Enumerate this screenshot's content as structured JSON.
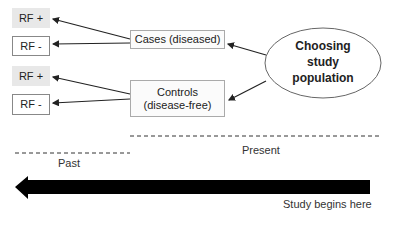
{
  "diagram": {
    "root": {
      "label_lines": [
        "Choosing",
        "study",
        "population"
      ]
    },
    "groups": [
      {
        "label": "Cases (diseased)",
        "children": [
          "RF +",
          "RF -"
        ]
      },
      {
        "label_lines": [
          "Controls",
          "(disease-free)"
        ],
        "children": [
          "RF +",
          "RF -"
        ]
      }
    ],
    "risk_factor": {
      "positive": "RF +",
      "negative": "RF -"
    },
    "timeline": {
      "past_label": "Past",
      "present_label": "Present",
      "start_label": "Study begins here",
      "direction": "present-to-past"
    },
    "colors": {
      "rf_positive_fill": "#e8e8e8",
      "box_border": "#888888",
      "arrow": "#000000",
      "line": "#222222"
    }
  }
}
